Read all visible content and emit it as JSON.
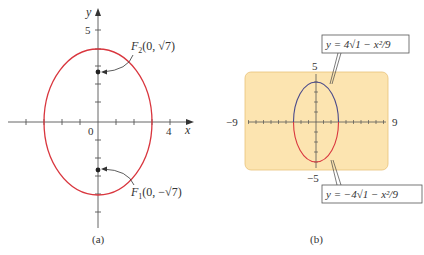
{
  "header_fragment": "gure 2(a).",
  "panel_a": {
    "caption": "(a)",
    "x_axis_label": "x",
    "y_axis_label": "y",
    "origin_label": "0",
    "x_tick_label": "4",
    "y_tick_label": "5",
    "focus_top": "F₂(0, √7)",
    "focus_bottom": "F₁(0, −√7)",
    "focus_top_F": "F",
    "focus_top_sub": "2",
    "focus_top_coords": "(0, √7)",
    "focus_bottom_F": "F",
    "focus_bottom_sub": "1",
    "focus_bottom_coords": "(0, −√7)",
    "ellipse_color": "#d9363e"
  },
  "panel_b": {
    "caption": "(b)",
    "x_min_label": "−9",
    "x_max_label": "9",
    "y_max_label": "5",
    "y_min_label": "−5",
    "upper_equation": "y = 4√1 − x²/9",
    "lower_equation": "y = −4√1 − x²/9",
    "screen_color": "#fce4b0",
    "upper_curve_color": "#4a4a8a",
    "lower_curve_color": "#d9363e"
  }
}
